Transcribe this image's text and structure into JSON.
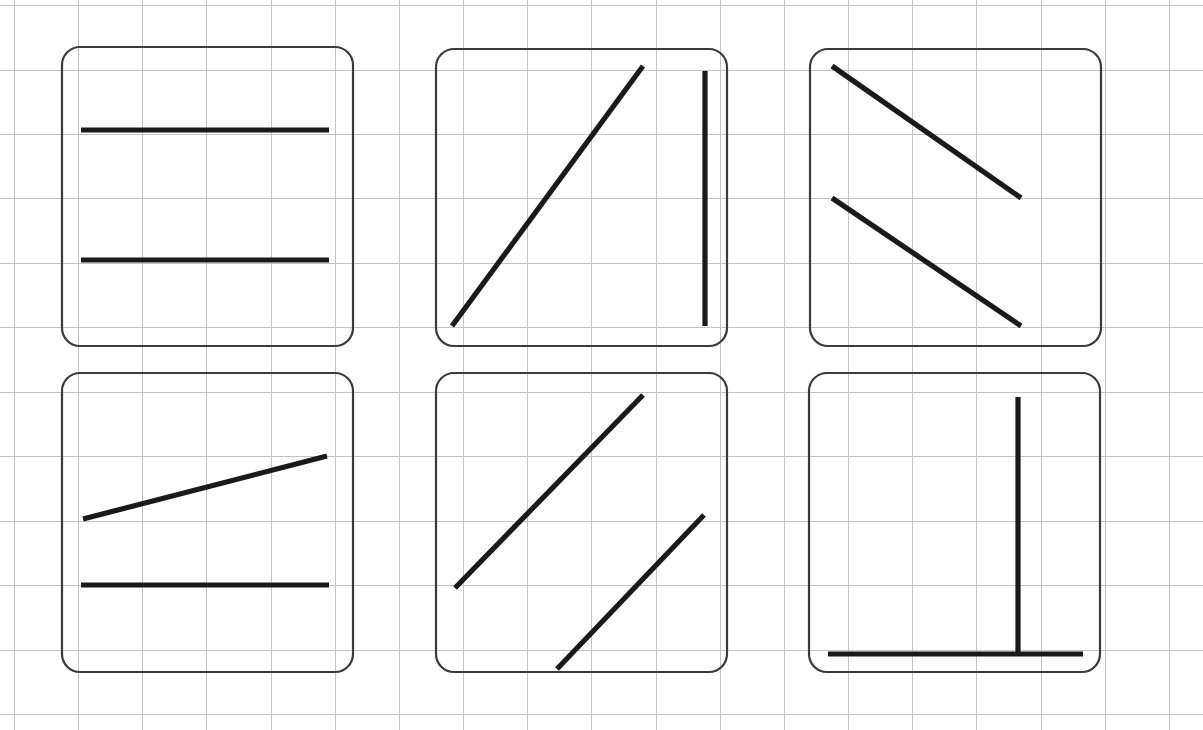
{
  "canvas": {
    "width": 1203,
    "height": 730,
    "background": "#ffffff"
  },
  "grid": {
    "color": "#c4c4c4",
    "stroke_width": 1,
    "spacing_x": 64,
    "spacing_y": 64.3,
    "x_lines": [
      14,
      78,
      142,
      206,
      271,
      335,
      399,
      463,
      527,
      591,
      656,
      720,
      784,
      848,
      912,
      976,
      1041,
      1105,
      1169
    ],
    "y_lines": [
      5,
      70,
      134,
      198,
      263,
      327,
      392,
      456,
      521,
      585,
      650,
      714
    ]
  },
  "panel_style": {
    "border_color": "#3b3b3b",
    "border_width": 2.2,
    "corner_radius": 18,
    "fill": "none",
    "line_color": "#1a1a1a",
    "line_width": 5.2,
    "line_cap": "butt"
  },
  "chart_data": {
    "type": "diagram",
    "title": "",
    "grid_on": true,
    "panel_count": 6,
    "rows": 2,
    "columns": 3
  },
  "panels": [
    {
      "id": "panel-1",
      "label": "two-horizontal-lines",
      "box": {
        "x": 62,
        "y": 47,
        "w": 291,
        "h": 299
      },
      "segments": [
        {
          "name": "upper-horizontal-line",
          "x1": 81,
          "y1": 130,
          "x2": 329,
          "y2": 130
        },
        {
          "name": "lower-horizontal-line",
          "x1": 81,
          "y1": 260,
          "x2": 329,
          "y2": 260
        }
      ]
    },
    {
      "id": "panel-2",
      "label": "diagonal-and-vertical-lines",
      "box": {
        "x": 436,
        "y": 49,
        "w": 291,
        "h": 297
      },
      "segments": [
        {
          "name": "rising-diagonal-line",
          "x1": 452,
          "y1": 326,
          "x2": 643,
          "y2": 66
        },
        {
          "name": "vertical-line",
          "x1": 705,
          "y1": 71,
          "x2": 705,
          "y2": 326
        }
      ]
    },
    {
      "id": "panel-3",
      "label": "two-falling-diagonal-lines",
      "box": {
        "x": 810,
        "y": 49,
        "w": 291,
        "h": 297
      },
      "segments": [
        {
          "name": "upper-falling-diagonal-line",
          "x1": 832,
          "y1": 66,
          "x2": 1021,
          "y2": 198
        },
        {
          "name": "lower-falling-diagonal-line",
          "x1": 832,
          "y1": 198,
          "x2": 1021,
          "y2": 326
        }
      ]
    },
    {
      "id": "panel-4",
      "label": "shallow-slope-and-horizontal-line",
      "box": {
        "x": 62,
        "y": 373,
        "w": 291,
        "h": 299
      },
      "segments": [
        {
          "name": "shallow-rising-line",
          "x1": 83,
          "y1": 519,
          "x2": 327,
          "y2": 456
        },
        {
          "name": "horizontal-line",
          "x1": 81,
          "y1": 585,
          "x2": 329,
          "y2": 585
        }
      ]
    },
    {
      "id": "panel-5",
      "label": "two-parallel-rising-diagonal-lines",
      "box": {
        "x": 436,
        "y": 373,
        "w": 291,
        "h": 299
      },
      "segments": [
        {
          "name": "upper-rising-diagonal-line",
          "x1": 455,
          "y1": 588,
          "x2": 643,
          "y2": 395
        },
        {
          "name": "lower-rising-diagonal-line",
          "x1": 557,
          "y1": 669,
          "x2": 704,
          "y2": 515
        }
      ]
    },
    {
      "id": "panel-6",
      "label": "vertical-and-horizontal-t-shape",
      "box": {
        "x": 809,
        "y": 373,
        "w": 291,
        "h": 299
      },
      "segments": [
        {
          "name": "vertical-stem-line",
          "x1": 1018,
          "y1": 397,
          "x2": 1018,
          "y2": 654
        },
        {
          "name": "horizontal-base-line",
          "x1": 828,
          "y1": 654,
          "x2": 1083,
          "y2": 654
        }
      ]
    }
  ]
}
